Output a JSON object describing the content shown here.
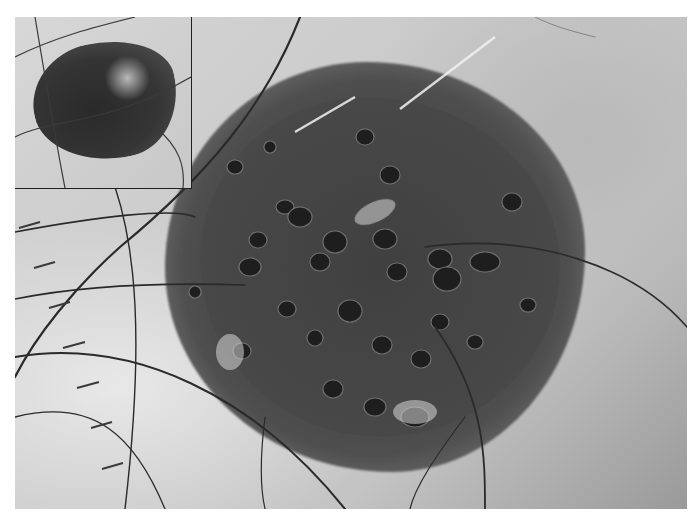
{
  "image": {
    "kind": "dermoscopy photograph",
    "description": "Grayscale dermoscopic image of a pigmented skin lesion with multiple comedo-like openings and crossing hairs; clinical inset in upper-left corner; scale ruler ticks along left edge",
    "colors": {
      "background_skin": "#cfcfcf",
      "lesion_dark": "#404040",
      "hair": "#2a2a2a",
      "inset_border": "#1f1f1f",
      "page": "#ffffff"
    },
    "inset": {
      "label": "clinical-close-up",
      "position": "top-left"
    },
    "scale_ruler": {
      "tick_count": 9,
      "position": "left-edge"
    }
  }
}
